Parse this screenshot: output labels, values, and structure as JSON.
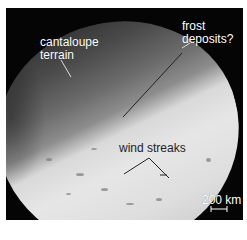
{
  "image": {
    "subject": "moon surface photograph",
    "labels": {
      "cantaloupe": [
        "cantaloupe",
        "terrain"
      ],
      "frost": [
        "frost",
        "deposits?"
      ],
      "wind": "wind streaks",
      "scale": "200 km"
    }
  }
}
